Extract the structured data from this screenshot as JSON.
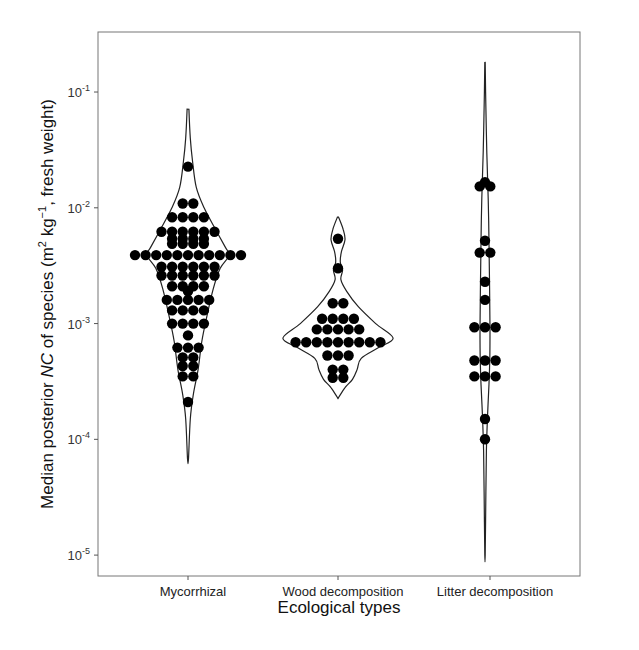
{
  "chart_data": {
    "type": "violin-dotplot",
    "title": "",
    "xlabel": "Ecological types",
    "ylabel_parts": {
      "prefix": "Median posterior ",
      "italic": "NC",
      "middle": " of species (m",
      "sup1": "2",
      "mid2": " kg",
      "sup2": "−1",
      "suffix": ", fresh weight)"
    },
    "yscale": "log10",
    "ylim": [
      6.6e-06,
      0.33
    ],
    "yticks": [
      {
        "value": 0.1,
        "base": "10",
        "exp": "-1"
      },
      {
        "value": 0.01,
        "base": "10",
        "exp": "-2"
      },
      {
        "value": 0.001,
        "base": "10",
        "exp": "-3"
      },
      {
        "value": 0.0001,
        "base": "10",
        "exp": "-4"
      },
      {
        "value": 1e-05,
        "base": "10",
        "exp": "-5"
      }
    ],
    "categories": [
      "Mycorrhizal",
      "Wood decomposition",
      "Litter decomposition"
    ],
    "grid": false,
    "legend": "none",
    "series": [
      {
        "name": "Mycorrhizal",
        "violin_range": [
          6.8e-05,
          0.071
        ],
        "violin_profile": [
          [
            0.071,
            0.02
          ],
          [
            0.04,
            0.05
          ],
          [
            0.025,
            0.1
          ],
          [
            0.015,
            0.18
          ],
          [
            0.01,
            0.35
          ],
          [
            0.0065,
            0.6
          ],
          [
            0.0045,
            0.82
          ],
          [
            0.0039,
            0.9
          ],
          [
            0.003,
            0.7
          ],
          [
            0.002,
            0.55
          ],
          [
            0.0012,
            0.42
          ],
          [
            0.0007,
            0.3
          ],
          [
            0.0004,
            0.22
          ],
          [
            0.00025,
            0.12
          ],
          [
            0.00015,
            0.05
          ],
          [
            6.8e-05,
            0.01
          ]
        ],
        "dot_rows": [
          {
            "value": 0.0227,
            "count": 1
          },
          {
            "value": 0.0109,
            "count": 2
          },
          {
            "value": 0.0083,
            "count": 4
          },
          {
            "value": 0.0062,
            "count": 6
          },
          {
            "value": 0.0054,
            "count": 4
          },
          {
            "value": 0.0049,
            "count": 4
          },
          {
            "value": 0.0039,
            "count": 11
          },
          {
            "value": 0.0031,
            "count": 6
          },
          {
            "value": 0.0026,
            "count": 6
          },
          {
            "value": 0.0021,
            "count": 4
          },
          {
            "value": 0.0019,
            "count": 1
          },
          {
            "value": 0.0016,
            "count": 5
          },
          {
            "value": 0.0013,
            "count": 4
          },
          {
            "value": 0.001,
            "count": 4
          },
          {
            "value": 0.00079,
            "count": 1
          },
          {
            "value": 0.00062,
            "count": 3
          },
          {
            "value": 0.00051,
            "count": 2
          },
          {
            "value": 0.00043,
            "count": 2
          },
          {
            "value": 0.00035,
            "count": 2
          },
          {
            "value": 0.00021,
            "count": 1
          }
        ]
      },
      {
        "name": "Wood decomposition",
        "violin_range": [
          0.00023,
          0.0083
        ],
        "violin_profile": [
          [
            0.0083,
            0.01
          ],
          [
            0.0065,
            0.09
          ],
          [
            0.0053,
            0.12
          ],
          [
            0.0042,
            0.06
          ],
          [
            0.0034,
            0.04
          ],
          [
            0.0029,
            0.08
          ],
          [
            0.0024,
            0.05
          ],
          [
            0.0019,
            0.15
          ],
          [
            0.0014,
            0.35
          ],
          [
            0.001,
            0.65
          ],
          [
            0.00075,
            0.95
          ],
          [
            0.00062,
            0.7
          ],
          [
            0.0005,
            0.4
          ],
          [
            0.0004,
            0.33
          ],
          [
            0.00033,
            0.25
          ],
          [
            0.00028,
            0.12
          ],
          [
            0.00023,
            0.01
          ]
        ],
        "dot_rows": [
          {
            "value": 0.0054,
            "count": 1
          },
          {
            "value": 0.003,
            "count": 1
          },
          {
            "value": 0.0015,
            "count": 2
          },
          {
            "value": 0.0011,
            "count": 4
          },
          {
            "value": 0.00089,
            "count": 5
          },
          {
            "value": 0.00069,
            "count": 9
          },
          {
            "value": 0.00053,
            "count": 3
          },
          {
            "value": 0.0004,
            "count": 2
          },
          {
            "value": 0.00034,
            "count": 2
          }
        ]
      },
      {
        "name": "Litter decomposition",
        "violin_range": [
          1e-05,
          0.18
        ],
        "violin_profile": [
          [
            0.18,
            0.01
          ],
          [
            0.08,
            0.04
          ],
          [
            0.03,
            0.09
          ],
          [
            0.012,
            0.16
          ],
          [
            0.005,
            0.2
          ],
          [
            0.002,
            0.23
          ],
          [
            0.0009,
            0.25
          ],
          [
            0.0005,
            0.24
          ],
          [
            0.0003,
            0.2
          ],
          [
            0.00015,
            0.12
          ],
          [
            8e-05,
            0.07
          ],
          [
            3e-05,
            0.04
          ],
          [
            1e-05,
            0.01
          ]
        ],
        "dot_rows": [
          {
            "value": 0.0166,
            "count": 1
          },
          {
            "value": 0.0153,
            "count": 2
          },
          {
            "value": 0.0052,
            "count": 1
          },
          {
            "value": 0.0041,
            "count": 2
          },
          {
            "value": 0.0023,
            "count": 1
          },
          {
            "value": 0.0016,
            "count": 1
          },
          {
            "value": 0.00093,
            "count": 3
          },
          {
            "value": 0.00048,
            "count": 3
          },
          {
            "value": 0.00035,
            "count": 3
          },
          {
            "value": 0.00015,
            "count": 1
          },
          {
            "value": 0.0001,
            "count": 1
          }
        ]
      }
    ]
  }
}
